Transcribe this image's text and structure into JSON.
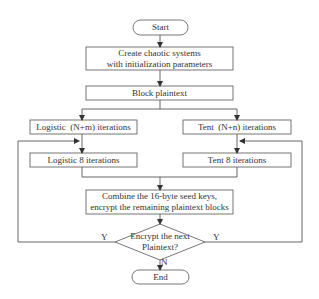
{
  "diagram": {
    "type": "flowchart",
    "colors": {
      "stroke": "#555555",
      "text": "#333333",
      "background": "#ffffff"
    },
    "nodes": {
      "start": {
        "label": "Start",
        "shape": "terminator"
      },
      "create": {
        "line1": "Create chaotic systems",
        "line2": "with initialization parameters",
        "shape": "process"
      },
      "block": {
        "label": "Block plaintext",
        "shape": "process"
      },
      "logistic_nm": {
        "label": "Logistic  (N+m) iterations",
        "shape": "process"
      },
      "tent_nn": {
        "label": "Tent  (N+n) iterations",
        "shape": "process"
      },
      "logistic_8": {
        "label": "Logistic 8 iterations",
        "shape": "process"
      },
      "tent_8": {
        "label": "Tent 8 iterations",
        "shape": "process"
      },
      "combine": {
        "line1": "Combine the 16-byte seed keys,",
        "line2": "encrypt the remaining plaintext blocks",
        "shape": "process"
      },
      "decision": {
        "line1": "Encrypt the next",
        "line2": "Plaintext?",
        "shape": "decision"
      },
      "end": {
        "label": "End",
        "shape": "terminator"
      }
    },
    "edge_labels": {
      "yes_left": "Y",
      "yes_right": "Y",
      "no": "N"
    },
    "edges": [
      [
        "start",
        "create"
      ],
      [
        "create",
        "block"
      ],
      [
        "block",
        "logistic_nm"
      ],
      [
        "block",
        "tent_nn"
      ],
      [
        "logistic_nm",
        "logistic_8"
      ],
      [
        "tent_nn",
        "tent_8"
      ],
      [
        "logistic_8",
        "combine"
      ],
      [
        "tent_8",
        "combine"
      ],
      [
        "combine",
        "decision"
      ],
      [
        "decision",
        "logistic_8",
        "Y"
      ],
      [
        "decision",
        "tent_8",
        "Y"
      ],
      [
        "decision",
        "end",
        "N"
      ]
    ]
  }
}
